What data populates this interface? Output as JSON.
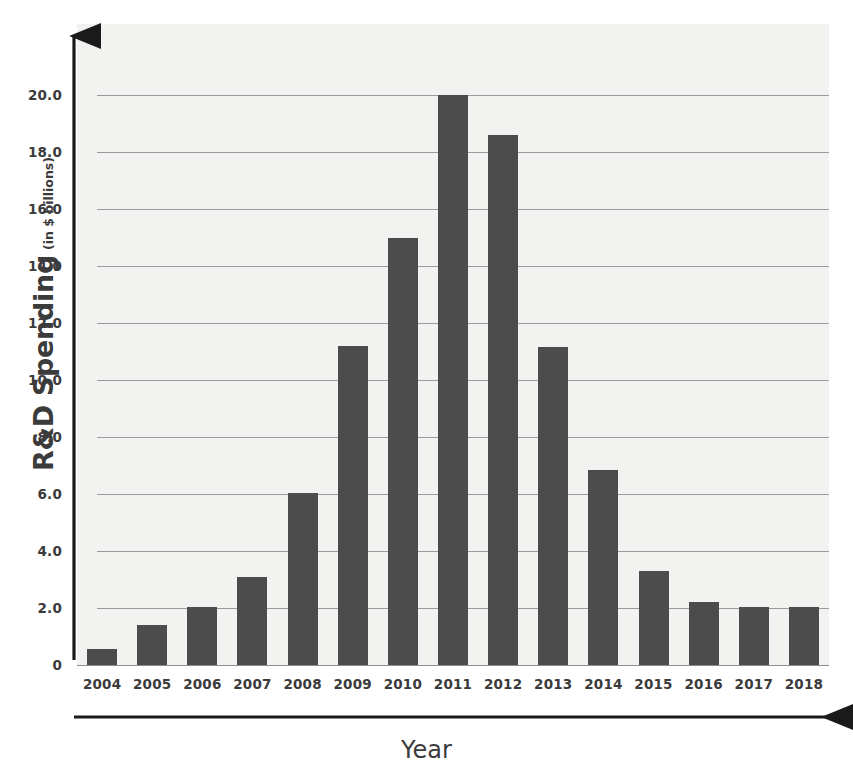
{
  "chart_data": {
    "type": "bar",
    "title": "",
    "xlabel": "Year",
    "ylabel": "R&D Spending",
    "ylabel_main": "R&D Spending",
    "ylabel_unit": "(in $ billions)",
    "categories": [
      "2004",
      "2005",
      "2006",
      "2007",
      "2008",
      "2009",
      "2010",
      "2011",
      "2012",
      "2013",
      "2014",
      "2015",
      "2016",
      "2017",
      "2018"
    ],
    "values": [
      0.55,
      1.4,
      2.05,
      3.1,
      6.05,
      11.2,
      15.0,
      20.0,
      18.6,
      11.15,
      6.85,
      3.3,
      2.2,
      2.05,
      2.05
    ],
    "series": [
      {
        "name": "R&D Spending",
        "values": [
          0.55,
          1.4,
          2.05,
          3.1,
          6.05,
          11.2,
          15.0,
          20.0,
          18.6,
          11.15,
          6.85,
          3.3,
          2.2,
          2.05,
          2.05
        ]
      }
    ],
    "ylim": [
      0,
      20
    ],
    "xlim_categories": 15,
    "y_ticks": [
      20.0,
      18.0,
      16.0,
      14.0,
      12.0,
      10.0,
      8.0,
      6.0,
      4.0,
      2.0,
      0
    ],
    "y_tick_labels": [
      "20.0",
      "18.0",
      "16.0",
      "14.0",
      "12.0",
      "10.0",
      "8.0",
      "6.0",
      "4.0",
      "2.0",
      "0"
    ],
    "grid": true,
    "grid_orientation": "horizontal",
    "legend": false,
    "legend_position": "none",
    "bar_color": "#4c4c4c",
    "plot_background": "#f2f2f0",
    "gridline_color": "#9b9b9b",
    "axis_color": "#1a1a1a",
    "text_color": "#3b3b3b",
    "axis_style": "arrow-headed"
  }
}
